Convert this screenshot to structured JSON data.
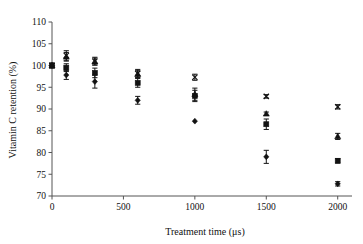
{
  "chart_data": {
    "type": "scatter",
    "title": "",
    "xlabel": "Treatment time (μs)",
    "ylabel": "Vitamin C retention (%)",
    "xlim": [
      0,
      2100
    ],
    "ylim": [
      70,
      110
    ],
    "xticks": [
      0,
      500,
      1000,
      1500,
      2000
    ],
    "xtick_labels": [
      "0",
      "500",
      "1000",
      "1500",
      "2000"
    ],
    "yticks": [
      70,
      75,
      80,
      85,
      90,
      95,
      100,
      105,
      110
    ],
    "ytick_labels": [
      "70",
      "75",
      "80",
      "85",
      "90",
      "95",
      "100",
      "105",
      "110"
    ],
    "grid": false,
    "legend": "none",
    "error_bars": "vertical standard-error",
    "x": [
      0,
      100,
      300,
      600,
      1000,
      1500,
      2000
    ],
    "series": [
      {
        "name": "series-cross",
        "marker": "x",
        "values": [
          100.0,
          102.3,
          101.0,
          98.2,
          97.3,
          92.9,
          90.5
        ],
        "errors": [
          0.5,
          1.1,
          0.9,
          0.9,
          0.7,
          0.4,
          0.5
        ]
      },
      {
        "name": "series-triangle",
        "marker": "triangle",
        "values": [
          100.0,
          102.0,
          100.9,
          98.0,
          93.4,
          88.9,
          83.7
        ],
        "errors": [
          0.5,
          1.0,
          0.8,
          0.8,
          1.4,
          0.4,
          0.7
        ]
      },
      {
        "name": "series-square",
        "marker": "square",
        "values": [
          100.0,
          99.5,
          98.3,
          96.0,
          93.0,
          86.5,
          78.1
        ],
        "errors": [
          0.5,
          0.9,
          1.1,
          1.0,
          1.3,
          1.2,
          0.5
        ]
      },
      {
        "name": "series-diamond",
        "marker": "diamond",
        "values": [
          100.0,
          97.8,
          96.3,
          92.0,
          87.2,
          79.0,
          72.8
        ],
        "errors": [
          0.5,
          1.0,
          1.5,
          0.9,
          0.0,
          1.5,
          0.5
        ]
      }
    ]
  }
}
